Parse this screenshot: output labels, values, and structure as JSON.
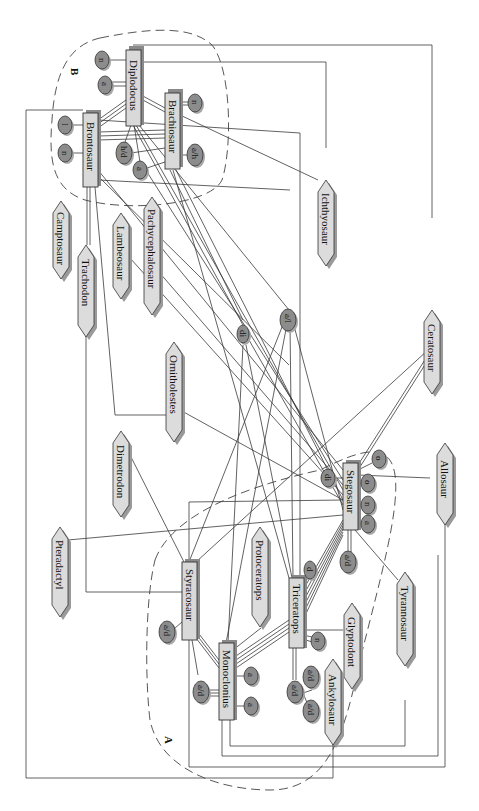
{
  "diagram": {
    "regions": [
      {
        "id": "A",
        "label": "A"
      },
      {
        "id": "B",
        "label": "B"
      }
    ],
    "entities": {
      "diplodocus": "Diplodocus",
      "brontosaur": "Brontosaur",
      "brachiosaur": "Brachiosaur",
      "stegosaur": "Stegosaur",
      "triceratops": "Triceratops",
      "monoclonius": "Monoclonius",
      "styracosaur": "Styracosaur"
    },
    "hexagons": {
      "camptosaur": "Camptosaur",
      "trachodon": "Trachodon",
      "lambeosaur": "Lambeosaur",
      "pachycephalosaur": "Pachycephalosaur",
      "ichthyosaur": "Ichthyosaur",
      "ornitholestes": "Ornitholestes",
      "dimetrodon": "Dimetrodon",
      "ceratosaur": "Ceratosaur",
      "pteradactyl": "Pteradactyl",
      "protoceratops": "Protoceratops",
      "allosaur": "Allosaur",
      "tyrannosaur": "Tyrannosaur",
      "glyptodont": "Glyptodont",
      "ankylosaur": "Ankylosaur"
    },
    "attributes": {
      "dip_n": "n",
      "dip_a": "a",
      "bro_l": "l",
      "bro_n": "n",
      "bra_n": "n",
      "bra_ah": "a/h",
      "hd": "h/d",
      "b_a": "a",
      "di_mid": "di",
      "al_mid": "a/l",
      "steg_di": "di",
      "steg_o1": "o",
      "steg_o2": "o",
      "steg_n": "n",
      "steg_a": "a",
      "steg_ad": "a/d",
      "tri_d": "d",
      "tri_n": "n",
      "tri_ad1": "a/d",
      "tri_ad2": "a/d",
      "tri_ad3": "a/d",
      "sty_ad": "a/d",
      "mon_ad": "a/d",
      "mon_a1": "a",
      "mon_a2": "a"
    }
  }
}
